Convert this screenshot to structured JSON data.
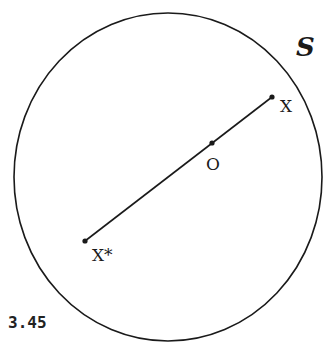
{
  "figure": {
    "number": "3.45",
    "set_label": "S",
    "points": {
      "x": {
        "label": "X",
        "cx": 272,
        "cy": 97
      },
      "o": {
        "label": "O",
        "cx": 212,
        "cy": 143
      },
      "x_star": {
        "label": "X*",
        "cx": 85,
        "cy": 241
      }
    },
    "circle": {
      "cx": 168,
      "cy": 177,
      "rx": 154,
      "ry": 164
    },
    "colors": {
      "stroke": "#1a1a1a",
      "background": "#ffffff"
    }
  }
}
